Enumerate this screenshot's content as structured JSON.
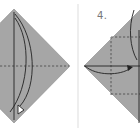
{
  "diagram": {
    "type": "origami-instruction",
    "panels": [
      {
        "id": "step-3",
        "label": "",
        "shape": "diamond",
        "fill": "#a6a6a6",
        "features": [
          "vertical-center-fold-line",
          "horizontal-dashed-crease",
          "curved-fold-arrow-down"
        ]
      },
      {
        "id": "step-4",
        "label": "4.",
        "shape": "diamond",
        "fill": "#a6a6a6",
        "features": [
          "horizontal-center-line",
          "dashed-valley-folds",
          "curved-fold-arrow-right"
        ]
      }
    ],
    "colors": {
      "paper": "#a6a6a6",
      "line": "#333333",
      "divider": "#dddddd",
      "background": "#ffffff"
    }
  }
}
